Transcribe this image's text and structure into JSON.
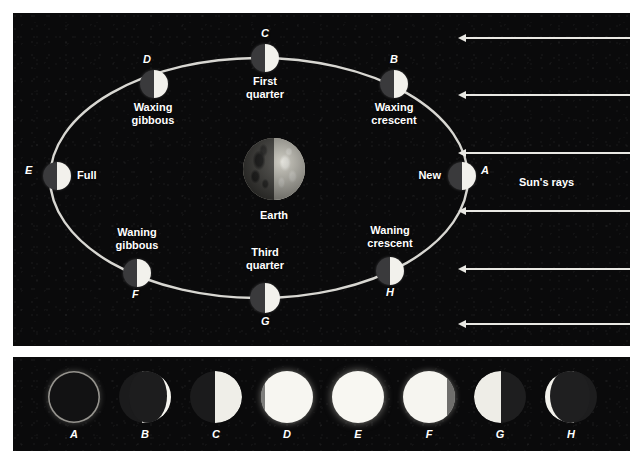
{
  "figure": {
    "background_color": "#ffffff",
    "panel_color": "#0a0a0b",
    "lit_color": "#f2f1ec",
    "dark_color": "#3a3a3c",
    "orbit_color": "#d8d7d2",
    "ray_color": "#e9e8e3"
  },
  "orbit_panel": {
    "center_body": {
      "name": "Earth",
      "label": "Earth"
    },
    "sun_rays": {
      "label": "Sun's rays",
      "direction": "right-to-left",
      "count": 6
    },
    "moons": [
      {
        "letter": "A",
        "phase_label": "New",
        "letter_side": "right",
        "label_side": "left",
        "x": 449,
        "y": 163,
        "size": 28,
        "lit_fraction": 0.5,
        "lit_side": "right"
      },
      {
        "letter": "B",
        "phase_label": "Waxing\ncrescent",
        "letter_side": "top",
        "label_side": "bottom",
        "x": 381,
        "y": 71,
        "size": 28,
        "lit_fraction": 0.5,
        "lit_side": "right"
      },
      {
        "letter": "C",
        "phase_label": "First\nquarter",
        "letter_side": "top",
        "label_side": "bottom",
        "x": 252,
        "y": 45,
        "size": 28,
        "lit_fraction": 0.5,
        "lit_side": "right"
      },
      {
        "letter": "D",
        "phase_label": "Waxing\ngibbous",
        "letter_side": "top",
        "label_side": "bottom",
        "x": 141,
        "y": 71,
        "size": 28,
        "lit_fraction": 0.5,
        "lit_side": "right"
      },
      {
        "letter": "E",
        "phase_label": "Full",
        "letter_side": "left",
        "label_side": "right",
        "x": 44,
        "y": 163,
        "size": 28,
        "lit_fraction": 0.5,
        "lit_side": "right"
      },
      {
        "letter": "F",
        "phase_label": "Waning\ngibbous",
        "letter_side": "bottom",
        "label_side": "top",
        "x": 124,
        "y": 260,
        "size": 28,
        "lit_fraction": 0.5,
        "lit_side": "right"
      },
      {
        "letter": "G",
        "phase_label": "Third\nquarter",
        "letter_side": "bottom",
        "label_side": "top",
        "x": 252,
        "y": 285,
        "size": 30,
        "lit_fraction": 0.5,
        "lit_side": "right"
      },
      {
        "letter": "H",
        "phase_label": "Waning\ncrescent",
        "letter_side": "bottom",
        "label_side": "top",
        "x": 377,
        "y": 258,
        "size": 28,
        "lit_fraction": 0.5,
        "lit_side": "right"
      }
    ]
  },
  "phase_panel": {
    "caption": "Photographs of the Moon as seen from Earth",
    "photos": [
      {
        "letter": "A",
        "appearance": "new-moon-ring",
        "illuminated_percent": 0,
        "lit_side": "none"
      },
      {
        "letter": "B",
        "appearance": "waxing-crescent",
        "illuminated_percent": 20,
        "lit_side": "right"
      },
      {
        "letter": "C",
        "appearance": "first-quarter",
        "illuminated_percent": 50,
        "lit_side": "right"
      },
      {
        "letter": "D",
        "appearance": "waxing-gibbous",
        "illuminated_percent": 95,
        "lit_side": "right"
      },
      {
        "letter": "E",
        "appearance": "full-moon",
        "illuminated_percent": 100,
        "lit_side": "all"
      },
      {
        "letter": "F",
        "appearance": "waning-gibbous",
        "illuminated_percent": 88,
        "lit_side": "left"
      },
      {
        "letter": "G",
        "appearance": "third-quarter",
        "illuminated_percent": 50,
        "lit_side": "left"
      },
      {
        "letter": "H",
        "appearance": "waning-crescent",
        "illuminated_percent": 25,
        "lit_side": "left"
      }
    ]
  }
}
